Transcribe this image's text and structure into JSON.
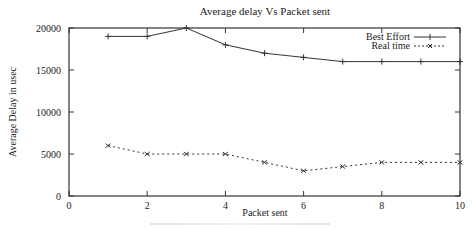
{
  "chart_data": {
    "type": "line",
    "title": "Average delay Vs Packet sent",
    "xlabel": "Packet sent",
    "ylabel": "Average Delay in usec",
    "xlim": [
      0,
      10
    ],
    "ylim": [
      0,
      20000
    ],
    "x_ticks": [
      0,
      2,
      4,
      6,
      8,
      10
    ],
    "y_ticks": [
      0,
      5000,
      10000,
      15000,
      20000
    ],
    "x_tick_labels": [
      "0",
      "2",
      "4",
      "6",
      "8",
      "10"
    ],
    "y_tick_labels": [
      "0",
      "5000",
      "10000",
      "15000",
      "20000"
    ],
    "grid": false,
    "legend_position": "top-right inside",
    "x": [
      1,
      2,
      3,
      4,
      5,
      6,
      7,
      8,
      9,
      10
    ],
    "series": [
      {
        "name": "Best Effort",
        "style": "solid",
        "marker": "+",
        "values": [
          19000,
          19000,
          20000,
          18000,
          17000,
          16500,
          16000,
          16000,
          16000,
          16000
        ]
      },
      {
        "name": "Real time",
        "style": "dotted",
        "marker": "x",
        "values": [
          6000,
          5000,
          5000,
          5000,
          4000,
          3000,
          3500,
          4000,
          4000,
          4000
        ]
      }
    ]
  },
  "colors": {
    "line": "#333333",
    "background": "#ffffff"
  }
}
